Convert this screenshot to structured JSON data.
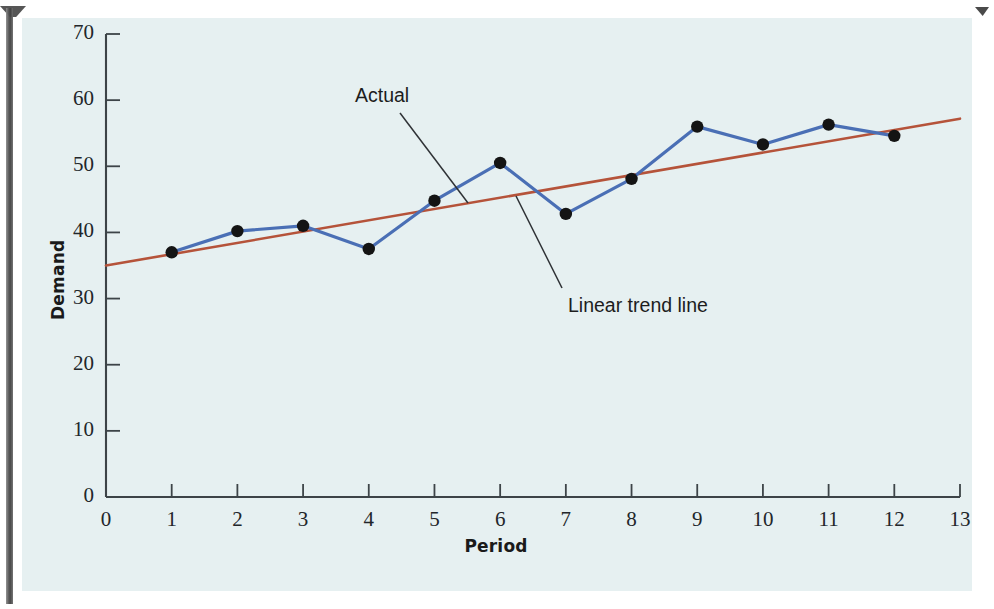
{
  "figure": {
    "background_color": "#e6f0f1",
    "page_color": "#ffffff"
  },
  "chart_data": {
    "type": "line",
    "title": "",
    "xlabel": "Period",
    "ylabel": "Demand",
    "xlim": [
      0,
      13
    ],
    "ylim": [
      0,
      70
    ],
    "xticks": [
      "0",
      "1",
      "2",
      "3",
      "4",
      "5",
      "6",
      "7",
      "8",
      "9",
      "10",
      "11",
      "12",
      "13"
    ],
    "yticks": [
      "0",
      "10",
      "20",
      "30",
      "40",
      "50",
      "60",
      "70"
    ],
    "grid": false,
    "legend_position": "annotated-callouts",
    "x": [
      1,
      2,
      3,
      4,
      5,
      6,
      7,
      8,
      9,
      10,
      11,
      12
    ],
    "series": [
      {
        "name": "Actual",
        "color": "#4a6fb5",
        "marker": "filled-circle",
        "marker_color": "#141414",
        "values": [
          37.0,
          40.2,
          41.0,
          37.5,
          44.8,
          50.5,
          42.8,
          48.1,
          56.0,
          53.3,
          56.3,
          54.6
        ]
      },
      {
        "name": "Linear trend line",
        "color": "#b5533a",
        "marker": "none",
        "endpoints_x": [
          0,
          13
        ],
        "endpoints_y": [
          35.0,
          57.2
        ]
      }
    ],
    "annotations": [
      {
        "id": "actual-callout",
        "text": "Actual",
        "points_to_series": "Actual"
      },
      {
        "id": "trend-callout",
        "text": "Linear trend line",
        "points_to_series": "Linear trend line"
      }
    ]
  }
}
